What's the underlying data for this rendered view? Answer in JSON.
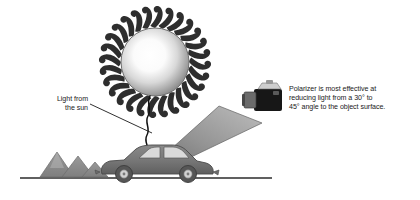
{
  "figure": {
    "background_color": "#ffffff",
    "ink_color": "#1a1a1a"
  },
  "labels": {
    "sun_label": "Light from\nthe sun",
    "polarizer_note": "Polarizer is most effective at\nreducing light from a 30° to\n45° angle to the object surface."
  },
  "callouts": {
    "angle_min": "30°",
    "angle_max": "45°"
  },
  "elements": {
    "sun": {
      "name": "sun",
      "ray_count": 28,
      "center_color": "#ffffff",
      "edge_color": "#8c8c8c",
      "outline_color": "#6e6e6e"
    },
    "car": {
      "name": "car",
      "body_color": "#737373",
      "window_color": "#d9d9d9",
      "wheel_color": "#5c5c5c"
    },
    "mountains": {
      "name": "mountains",
      "peak_count": 3,
      "fill_color": "#8f8f8f"
    },
    "camera": {
      "name": "camera",
      "body_color": "#171717",
      "top_plate_color": "#cfcfcf",
      "lens_color": "#6b6b6b"
    },
    "light_beam": {
      "name": "reflected-light-beam",
      "fill_start": "#6f6f6f",
      "fill_end": "#b8b8b8"
    },
    "ground_line": {
      "name": "ground-line",
      "color": "#2b2b2b"
    },
    "squiggle": {
      "name": "sun-to-car-light-path",
      "color": "#111111"
    }
  }
}
